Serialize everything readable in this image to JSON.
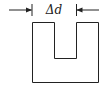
{
  "diagram": {
    "label": "Δd",
    "stroke_color": "#222222",
    "background": "#ffffff",
    "shape": "U-shaped block with rectangular notch cut from top",
    "dimension": {
      "name": "notch width",
      "symbol": "Δd",
      "arrows": "inward-pointing from both sides"
    }
  }
}
